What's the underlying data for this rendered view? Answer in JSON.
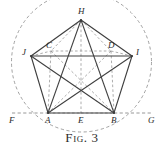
{
  "figure": {
    "caption": "Fig. 3",
    "caption_number": "3",
    "type": "geometric-construction-diagram",
    "colors": {
      "ink": "#3a3a3a",
      "ink_light": "#6f6f6f",
      "background": "#ffffff"
    },
    "points": [
      {
        "id": "A",
        "label": "A",
        "x": 48,
        "y": 113,
        "label_x": 45,
        "label_y": 116
      },
      {
        "id": "B",
        "label": "B",
        "x": 114,
        "y": 113,
        "label_x": 111,
        "label_y": 116
      },
      {
        "id": "C",
        "label": "C",
        "x": 51,
        "y": 51,
        "label_x": 46,
        "label_y": 41
      },
      {
        "id": "D",
        "label": "D",
        "x": 111,
        "y": 51,
        "label_x": 108,
        "label_y": 41
      },
      {
        "id": "E",
        "label": "E",
        "x": 81,
        "y": 113,
        "label_x": 78,
        "label_y": 116
      },
      {
        "id": "F",
        "label": "F",
        "x": 12,
        "y": 113,
        "label_x": 9,
        "label_y": 116
      },
      {
        "id": "G",
        "label": "G",
        "x": 151,
        "y": 113,
        "label_x": 148,
        "label_y": 116
      },
      {
        "id": "H",
        "label": "H",
        "x": 81,
        "y": 20,
        "label_x": 78,
        "label_y": 7
      },
      {
        "id": "I",
        "label": "I",
        "x": 132,
        "y": 56,
        "label_x": 136,
        "label_y": 48
      },
      {
        "id": "J",
        "label": "J",
        "x": 31,
        "y": 56,
        "label_x": 22,
        "label_y": 48
      }
    ],
    "circle": {
      "cx": 81.5,
      "cy": 62,
      "r": 70,
      "style": "dashed"
    },
    "solid_edges": [
      [
        "A",
        "B"
      ],
      [
        "B",
        "I"
      ],
      [
        "I",
        "H"
      ],
      [
        "H",
        "J"
      ],
      [
        "J",
        "A"
      ],
      [
        "A",
        "I"
      ],
      [
        "A",
        "H"
      ],
      [
        "B",
        "J"
      ],
      [
        "B",
        "H"
      ],
      [
        "J",
        "I"
      ]
    ],
    "dashed_edges": [
      [
        "F",
        "A"
      ],
      [
        "B",
        "G"
      ],
      [
        "A",
        "E"
      ],
      [
        "E",
        "B"
      ],
      [
        "H",
        "E"
      ],
      [
        "H",
        "A"
      ],
      [
        "H",
        "B"
      ],
      [
        "H",
        "C"
      ],
      [
        "H",
        "D"
      ],
      [
        "C",
        "A"
      ],
      [
        "D",
        "B"
      ],
      [
        "C",
        "D"
      ],
      [
        "C",
        "B"
      ],
      [
        "D",
        "A"
      ],
      [
        "J",
        "C"
      ],
      [
        "D",
        "I"
      ]
    ]
  }
}
